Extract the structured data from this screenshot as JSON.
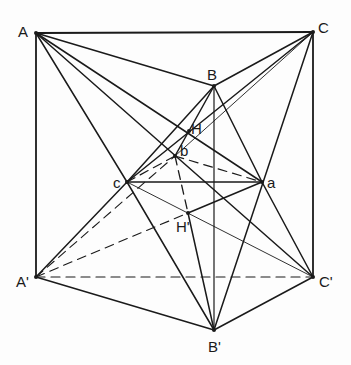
{
  "diagram": {
    "title": "",
    "stroke_color": "#1a1a1a",
    "points": {
      "A": {
        "x": 36,
        "y": 33,
        "label": "A",
        "lx": 18,
        "ly": 37
      },
      "C": {
        "x": 313,
        "y": 32,
        "label": "C",
        "lx": 318,
        "ly": 33
      },
      "B": {
        "x": 214,
        "y": 86,
        "label": "B",
        "lx": 207,
        "ly": 80
      },
      "H": {
        "x": 189,
        "y": 131,
        "label": "H",
        "lx": 191,
        "ly": 134
      },
      "b": {
        "x": 175,
        "y": 156,
        "label": "b",
        "lx": 180,
        "ly": 156
      },
      "c": {
        "x": 127,
        "y": 182,
        "label": "c",
        "lx": 113,
        "ly": 188
      },
      "a": {
        "x": 262,
        "y": 182,
        "label": "a",
        "lx": 267,
        "ly": 188
      },
      "H'": {
        "x": 188,
        "y": 213,
        "label": "H'",
        "lx": 176,
        "ly": 232
      },
      "A'": {
        "x": 36,
        "y": 277,
        "label": "A'",
        "lx": 16,
        "ly": 287
      },
      "C'": {
        "x": 313,
        "y": 277,
        "label": "C'",
        "lx": 319,
        "ly": 287
      },
      "B'": {
        "x": 214,
        "y": 330,
        "label": "B'",
        "lx": 208,
        "ly": 352
      }
    },
    "segments": [
      {
        "from": "A",
        "to": "C",
        "style": "solid",
        "w": 1.8
      },
      {
        "from": "A",
        "to": "A'",
        "style": "solid",
        "w": 1.8
      },
      {
        "from": "C",
        "to": "C'",
        "style": "solid",
        "w": 1.8
      },
      {
        "from": "A'",
        "to": "C'",
        "style": "dashed",
        "w": 1.2
      },
      {
        "from": "A",
        "to": "B",
        "style": "solid",
        "w": 1.5
      },
      {
        "from": "B",
        "to": "C",
        "style": "solid",
        "w": 1.5
      },
      {
        "from": "A",
        "to": "a",
        "style": "solid",
        "w": 1.5
      },
      {
        "from": "A",
        "to": "C'",
        "style": "solid",
        "w": 1.5
      },
      {
        "from": "A",
        "to": "c",
        "style": "solid",
        "w": 1.5
      },
      {
        "from": "C",
        "to": "c",
        "style": "solid",
        "w": 1.5
      },
      {
        "from": "C",
        "to": "b",
        "style": "solid",
        "w": 0.9
      },
      {
        "from": "C",
        "to": "B'",
        "style": "solid",
        "w": 1.5
      },
      {
        "from": "B",
        "to": "c",
        "style": "solid",
        "w": 1.5
      },
      {
        "from": "c",
        "to": "A'",
        "style": "solid",
        "w": 1.5
      },
      {
        "from": "B",
        "to": "a",
        "style": "solid",
        "w": 1.5
      },
      {
        "from": "a",
        "to": "C'",
        "style": "solid",
        "w": 1.5
      },
      {
        "from": "B",
        "to": "B'",
        "style": "solid",
        "w": 1.2
      },
      {
        "from": "B",
        "to": "b",
        "style": "solid",
        "w": 1.5
      },
      {
        "from": "c",
        "to": "a",
        "style": "solid",
        "w": 1.4
      },
      {
        "from": "c",
        "to": "B'",
        "style": "solid",
        "w": 1.5
      },
      {
        "from": "H'",
        "to": "a",
        "style": "solid",
        "w": 1.5
      },
      {
        "from": "H'",
        "to": "B'",
        "style": "solid",
        "w": 1.5
      },
      {
        "from": "c",
        "to": "C'",
        "style": "solid",
        "w": 0.9
      },
      {
        "from": "A'",
        "to": "B'",
        "style": "solid",
        "w": 1.5
      },
      {
        "from": "B'",
        "to": "C'",
        "style": "solid",
        "w": 1.5
      },
      {
        "from": "A'",
        "to": "b",
        "style": "dashed",
        "w": 1.1
      },
      {
        "from": "A'",
        "to": "H'",
        "style": "dashed",
        "w": 1.1
      },
      {
        "from": "c",
        "to": "b",
        "style": "dashed",
        "w": 1.2
      },
      {
        "from": "b",
        "to": "a",
        "style": "dashed",
        "w": 1.2
      },
      {
        "from": "b",
        "to": "H'",
        "style": "dashed",
        "w": 1.3
      }
    ]
  }
}
